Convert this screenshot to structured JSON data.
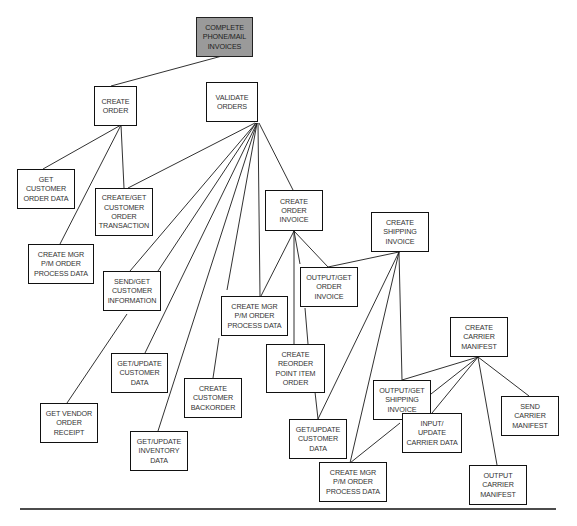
{
  "diagram": {
    "type": "hierarchy-chart",
    "colors": {
      "root_fill": "#9a9a9a",
      "node_fill": "#ffffff",
      "border": "#111111",
      "text": "#333333",
      "line": "#1a1a1a"
    },
    "nodes": {
      "root": {
        "label": "COMPLETE\nPHONE/MAIL\nINVOICES"
      },
      "create_order": {
        "label": "CREATE\nORDER"
      },
      "validate_orders": {
        "label": "VALIDATE\nORDERS"
      },
      "get_customer_order_data": {
        "label": "GET\nCUSTOMER\nORDER DATA"
      },
      "create_get_customer_order_transaction": {
        "label": "CREATE/GET\nCUSTOMER\nORDER\nTRANSACTION"
      },
      "create_mgr_left": {
        "label": "CREATE MGR\nP/M ORDER\nPROCESS DATA"
      },
      "send_get_customer_information": {
        "label": "SEND/GET\nCUSTOMER\nINFORMATION"
      },
      "get_update_customer_data_left": {
        "label": "GET/UPDATE\nCUSTOMER\nDATA"
      },
      "get_vendor_order_receipt": {
        "label": "GET VENDOR\nORDER\nRECEIPT"
      },
      "get_update_inventory_data": {
        "label": "GET/UPDATE\nINVENTORY\nDATA"
      },
      "create_customer_backorder": {
        "label": "CREATE\nCUSTOMER\nBACKORDER"
      },
      "create_order_invoice": {
        "label": "CREATE\nORDER\nINVOICE"
      },
      "create_mgr_middle": {
        "label": "CREATE MGR\nP/M ORDER\nPROCESS DATA"
      },
      "create_reorder_point_item_order": {
        "label": "CREATE\nREORDER\nPOINT ITEM\nORDER"
      },
      "output_get_order_invoice": {
        "label": "OUTPUT/GET\nORDER\nINVOICE"
      },
      "create_shipping_invoice": {
        "label": "CREATE\nSHIPPING\nINVOICE"
      },
      "get_update_customer_data_right": {
        "label": "GET/UPDATE\nCUSTOMER\nDATA"
      },
      "create_mgr_right": {
        "label": "CREATE MGR\nP/M ORDER\nPROCESS DATA"
      },
      "create_carrier_manifest": {
        "label": "CREATE\nCARRIER\nMANIFEST"
      },
      "output_get_shipping_invoice": {
        "label": "OUTPUT/GET\nSHIPPING\nINVOICE"
      },
      "input_update_carrier_data": {
        "label": "INPUT/\nUPDATE\nCARRIER DATA"
      },
      "send_carrier_manifest": {
        "label": "SEND\nCARRIER\nMANIFEST"
      },
      "output_carrier_manifest": {
        "label": "OUTPUT\nCARRIER\nMANIFEST"
      }
    },
    "edges": [
      {
        "from": "root",
        "to": "create_order"
      },
      {
        "from": "create_order",
        "to": "get_customer_order_data"
      },
      {
        "from": "create_order",
        "to": "create_mgr_left"
      },
      {
        "from": "create_order",
        "to": "create_get_customer_order_transaction"
      },
      {
        "from": "validate_orders",
        "to": "create_get_customer_order_transaction"
      },
      {
        "from": "validate_orders",
        "to": "send_get_customer_information"
      },
      {
        "from": "validate_orders",
        "to": "get_vendor_order_receipt"
      },
      {
        "from": "validate_orders",
        "to": "get_update_customer_data_left"
      },
      {
        "from": "validate_orders",
        "to": "get_update_inventory_data"
      },
      {
        "from": "validate_orders",
        "to": "create_customer_backorder"
      },
      {
        "from": "validate_orders",
        "to": "create_mgr_middle"
      },
      {
        "from": "validate_orders",
        "to": "create_order_invoice"
      },
      {
        "from": "create_order_invoice",
        "to": "create_mgr_middle"
      },
      {
        "from": "create_order_invoice",
        "to": "create_reorder_point_item_order"
      },
      {
        "from": "create_order_invoice",
        "to": "output_get_order_invoice"
      },
      {
        "from": "create_order_invoice",
        "to": "get_update_customer_data_right"
      },
      {
        "from": "create_shipping_invoice",
        "to": "output_get_order_invoice"
      },
      {
        "from": "create_shipping_invoice",
        "to": "get_update_customer_data_right"
      },
      {
        "from": "create_shipping_invoice",
        "to": "create_mgr_right"
      },
      {
        "from": "create_shipping_invoice",
        "to": "output_get_shipping_invoice"
      },
      {
        "from": "create_carrier_manifest",
        "to": "output_get_shipping_invoice"
      },
      {
        "from": "create_carrier_manifest",
        "to": "create_mgr_right"
      },
      {
        "from": "create_carrier_manifest",
        "to": "input_update_carrier_data"
      },
      {
        "from": "create_carrier_manifest",
        "to": "output_carrier_manifest"
      },
      {
        "from": "create_carrier_manifest",
        "to": "send_carrier_manifest"
      }
    ]
  }
}
